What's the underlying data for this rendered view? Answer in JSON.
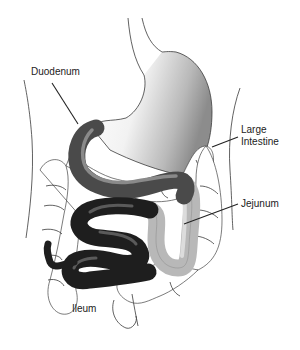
{
  "diagram": {
    "type": "anatomical-illustration",
    "labels": [
      {
        "id": "duodenum",
        "text": "Duodenum"
      },
      {
        "id": "large_intestine",
        "text": "Large\nIntestine"
      },
      {
        "id": "jejunum",
        "text": "Jejunum"
      },
      {
        "id": "ileum",
        "text": "Ileum"
      }
    ],
    "colors": {
      "background": "#ffffff",
      "outline": "#3a3a3a",
      "stomach_light": "#f4f4f4",
      "stomach_shade": "#9a9a9a",
      "duodenum": "#4a4a4a",
      "duodenum_highlight": "#8a8a8a",
      "jejunum": "#b8b8b8",
      "jejunum_highlight": "#dcdcdc",
      "ileum": "#1e1e1e",
      "ileum_highlight": "#5a5a5a",
      "leader_line": "#222222"
    }
  }
}
